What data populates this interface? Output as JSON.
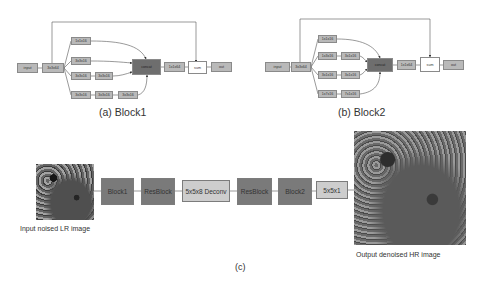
{
  "block1": {
    "caption": "(a) Block1",
    "input": "input",
    "stem": "3x3x64",
    "branches": [
      [
        "1x1x16"
      ],
      [
        "3x3x16"
      ],
      [
        "3x3x16",
        "3x3x16"
      ],
      [
        "3x3x16",
        "3x3x16",
        "3x3x16"
      ]
    ],
    "concat": "concat",
    "proj": "1x1x64",
    "sum": "sum",
    "output": "out"
  },
  "block2": {
    "caption": "(b) Block2",
    "input": "input",
    "stem": "3x3x64",
    "branches": [
      [
        "1x1x16"
      ],
      [
        "1x3x16",
        "3x1x16"
      ],
      [
        "3x1x16",
        "3x1x16"
      ],
      [
        "1x7x16",
        "7x1x16"
      ]
    ],
    "concat": "concat",
    "proj": "1x1x64",
    "sum": "sum",
    "output": "out"
  },
  "pipeline": {
    "caption": "(c)",
    "input_image_label": "Input noised LR image",
    "output_image_label": "Output denoised HR image",
    "stages": [
      "Block1",
      "ResBlock",
      "5x5x8 Deconv",
      "ResBlock",
      "Block2",
      "5x5x1"
    ]
  }
}
